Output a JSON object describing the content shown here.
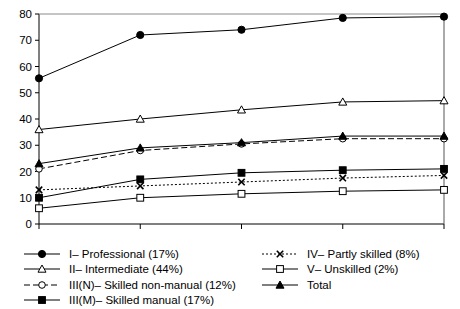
{
  "chart_data": {
    "type": "line",
    "title": "",
    "xlabel": "",
    "ylabel": "",
    "categories": [
      "1991–2",
      "1992–3",
      "1993–4",
      "1994–5",
      "1995–6"
    ],
    "ylim": [
      0,
      80
    ],
    "yticks": [
      0,
      10,
      20,
      30,
      40,
      50,
      60,
      70,
      80
    ],
    "grid": false,
    "legend_position": "bottom",
    "series": [
      {
        "name": "I– Professional (17%)",
        "key": "professional",
        "marker": "filled-circle",
        "line": "solid",
        "values": [
          55.5,
          72,
          74,
          78.5,
          79
        ]
      },
      {
        "name": "II– Intermediate (44%)",
        "key": "intermediate",
        "marker": "open-triangle",
        "line": "solid",
        "values": [
          36,
          40,
          43.5,
          46.5,
          47
        ]
      },
      {
        "name": "III(N)– Skilled non-manual (12%)",
        "key": "skilled-non-manual",
        "marker": "open-circle",
        "line": "dashed",
        "values": [
          21,
          28,
          30.5,
          32.5,
          32.5
        ]
      },
      {
        "name": "III(M)– Skilled manual (17%)",
        "key": "skilled-manual",
        "marker": "filled-square",
        "line": "solid",
        "values": [
          10,
          17,
          19.5,
          20.5,
          21
        ]
      },
      {
        "name": "IV– Partly skilled (8%)",
        "key": "partly-skilled",
        "marker": "cross",
        "line": "dotted",
        "values": [
          13,
          14.5,
          16,
          17.5,
          18.5
        ]
      },
      {
        "name": "V– Unskilled (2%)",
        "key": "unskilled",
        "marker": "open-square",
        "line": "solid",
        "values": [
          6,
          10,
          11.5,
          12.5,
          13
        ]
      },
      {
        "name": "Total",
        "key": "total",
        "marker": "filled-triangle",
        "line": "solid",
        "values": [
          23,
          29,
          31,
          33.5,
          33.5
        ]
      }
    ]
  },
  "legend": {
    "left_column": [
      "I– Professional (17%)",
      "II– Intermediate (44%)",
      "III(N)– Skilled non-manual (12%)",
      "III(M)– Skilled manual (17%)"
    ],
    "right_column": [
      "IV– Partly skilled (8%)",
      "V– Unskilled (2%)",
      "Total"
    ]
  },
  "colors": {
    "line": "#000000",
    "axis": "#000000",
    "background": "#ffffff"
  }
}
